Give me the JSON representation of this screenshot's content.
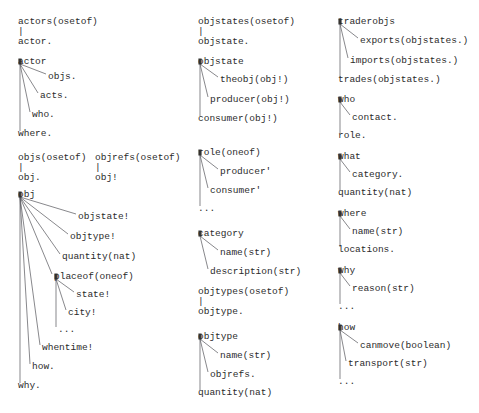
{
  "diagram": {
    "background_color": "#ffffff",
    "text_color": "#2b2b2b",
    "edge_color": "#55555a",
    "font": "monospace",
    "columns": [
      {
        "name": "column-left",
        "x": 18,
        "groups": [
          {
            "name": "actors-group",
            "root": "actors(osetof)",
            "connector": "|",
            "children": [
              "actor."
            ]
          },
          {
            "name": "actor-group",
            "root": "actor",
            "children": [
              "objs.",
              "acts.",
              "who.",
              "where."
            ]
          },
          {
            "name": "objs-group",
            "root": "objs(osetof)",
            "connector": "|",
            "children": [
              "obj."
            ]
          },
          {
            "name": "objrefs-group",
            "root": "objrefs(osetof)",
            "connector": "|",
            "children": [
              "obj!"
            ]
          },
          {
            "name": "obj-group",
            "root": "obj",
            "children": [
              "objstate!",
              "objtype!",
              "quantity(nat)",
              "placeof(oneof)",
              "whentime!",
              "how.",
              "why."
            ],
            "subgroup": {
              "name": "placeof-subgroup",
              "root": "placeof(oneof)",
              "children": [
                "state!",
                "city!",
                "..."
              ]
            }
          }
        ]
      },
      {
        "name": "column-middle",
        "x": 198,
        "groups": [
          {
            "name": "objstates-group",
            "root": "objstates(osetof)",
            "connector": "|",
            "children": [
              "objstate."
            ]
          },
          {
            "name": "objstate-group",
            "root": "objstate",
            "children": [
              "theobj(obj!)",
              "producer(obj!)",
              "consumer(obj!)"
            ]
          },
          {
            "name": "role-group",
            "root": "role(oneof)",
            "children": [
              "producer'",
              "consumer'",
              "..."
            ]
          },
          {
            "name": "category-group",
            "root": "category",
            "children": [
              "name(str)",
              "description(str)"
            ]
          },
          {
            "name": "objtypes-group",
            "root": "objtypes(osetof)",
            "connector": "|",
            "children": [
              "objtype."
            ]
          },
          {
            "name": "objtype-group",
            "root": "objtype",
            "children": [
              "name(str)",
              "objrefs.",
              "quantity(nat)"
            ]
          }
        ]
      },
      {
        "name": "column-right",
        "x": 338,
        "groups": [
          {
            "name": "traderobjs-group",
            "root": "traderobjs",
            "children": [
              "exports(objstates.)",
              "imports(objstates.)",
              "trades(objstates.)"
            ]
          },
          {
            "name": "who-group",
            "root": "who",
            "children": [
              "contact.",
              "role."
            ]
          },
          {
            "name": "what-group",
            "root": "what",
            "children": [
              "category.",
              "quantity(nat)"
            ]
          },
          {
            "name": "where-group",
            "root": "where",
            "children": [
              "name(str)",
              "locations."
            ]
          },
          {
            "name": "why-group",
            "root": "why",
            "children": [
              "reason(str)",
              "..."
            ]
          },
          {
            "name": "how-group",
            "root": "how",
            "children": [
              "canmove(boolean)",
              "transport(str)",
              "..."
            ]
          }
        ]
      }
    ],
    "labels": [
      {
        "id": "l1",
        "text": "actors(osetof)",
        "x": 18,
        "y": 17,
        "name": "node-actors"
      },
      {
        "id": "l2",
        "text": "|",
        "x": 18,
        "y": 27,
        "name": "connector-actors"
      },
      {
        "id": "l3",
        "text": "actor.",
        "x": 18,
        "y": 37,
        "name": "node-actor-ref"
      },
      {
        "id": "l4",
        "text": "actor",
        "x": 18,
        "y": 57,
        "name": "node-actor"
      },
      {
        "id": "l5",
        "text": "objs.",
        "x": 48,
        "y": 72,
        "name": "node-actor-objs"
      },
      {
        "id": "l6",
        "text": "acts.",
        "x": 40,
        "y": 91,
        "name": "node-actor-acts"
      },
      {
        "id": "l7",
        "text": "who.",
        "x": 32,
        "y": 110,
        "name": "node-actor-who"
      },
      {
        "id": "l8",
        "text": "where.",
        "x": 18,
        "y": 129,
        "name": "node-actor-where"
      },
      {
        "id": "l9",
        "text": "objs(osetof)",
        "x": 18,
        "y": 153,
        "name": "node-objs"
      },
      {
        "id": "l10",
        "text": "|",
        "x": 18,
        "y": 163,
        "name": "connector-objs"
      },
      {
        "id": "l11",
        "text": "obj.",
        "x": 18,
        "y": 173,
        "name": "node-obj-ref"
      },
      {
        "id": "l12",
        "text": "objrefs(osetof)",
        "x": 95,
        "y": 153,
        "name": "node-objrefs"
      },
      {
        "id": "l13",
        "text": "|",
        "x": 95,
        "y": 163,
        "name": "connector-objrefs"
      },
      {
        "id": "l14",
        "text": "obj!",
        "x": 95,
        "y": 173,
        "name": "node-obj-bang"
      },
      {
        "id": "l15",
        "text": "obj",
        "x": 18,
        "y": 190,
        "name": "node-obj"
      },
      {
        "id": "l16",
        "text": "objstate!",
        "x": 78,
        "y": 212,
        "name": "node-obj-objstate"
      },
      {
        "id": "l17",
        "text": "objtype!",
        "x": 70,
        "y": 232,
        "name": "node-obj-objtype"
      },
      {
        "id": "l18",
        "text": "quantity(nat)",
        "x": 62,
        "y": 252,
        "name": "node-obj-quantity"
      },
      {
        "id": "l19",
        "text": "placeof(oneof)",
        "x": 54,
        "y": 272,
        "name": "node-obj-placeof"
      },
      {
        "id": "l20",
        "text": "state!",
        "x": 76,
        "y": 290,
        "name": "node-placeof-state"
      },
      {
        "id": "l21",
        "text": "city!",
        "x": 68,
        "y": 308,
        "name": "node-placeof-city"
      },
      {
        "id": "l22",
        "text": "...",
        "x": 58,
        "y": 325,
        "name": "node-placeof-more"
      },
      {
        "id": "l23",
        "text": "whentime!",
        "x": 42,
        "y": 343,
        "name": "node-obj-whentime"
      },
      {
        "id": "l24",
        "text": "how.",
        "x": 32,
        "y": 362,
        "name": "node-obj-how"
      },
      {
        "id": "l25",
        "text": "why.",
        "x": 18,
        "y": 381,
        "name": "node-obj-why"
      },
      {
        "id": "m1",
        "text": "objstates(osetof)",
        "x": 198,
        "y": 17,
        "name": "node-objstates"
      },
      {
        "id": "m2",
        "text": "|",
        "x": 198,
        "y": 27,
        "name": "connector-objstates"
      },
      {
        "id": "m3",
        "text": "objstate.",
        "x": 198,
        "y": 37,
        "name": "node-objstate-ref"
      },
      {
        "id": "m4",
        "text": "objstate",
        "x": 198,
        "y": 57,
        "name": "node-objstate"
      },
      {
        "id": "m5",
        "text": "theobj(obj!)",
        "x": 220,
        "y": 75,
        "name": "node-objstate-theobj"
      },
      {
        "id": "m6",
        "text": "producer(obj!)",
        "x": 210,
        "y": 95,
        "name": "node-objstate-producer"
      },
      {
        "id": "m7",
        "text": "consumer(obj!)",
        "x": 198,
        "y": 114,
        "name": "node-objstate-consumer"
      },
      {
        "id": "m8",
        "text": "role(oneof)",
        "x": 198,
        "y": 148,
        "name": "node-role"
      },
      {
        "id": "m9",
        "text": "producer'",
        "x": 220,
        "y": 167,
        "name": "node-role-producer"
      },
      {
        "id": "m10",
        "text": "consumer'",
        "x": 210,
        "y": 186,
        "name": "node-role-consumer"
      },
      {
        "id": "m11",
        "text": "...",
        "x": 198,
        "y": 204,
        "name": "node-role-more"
      },
      {
        "id": "m12",
        "text": "category",
        "x": 198,
        "y": 229,
        "name": "node-category"
      },
      {
        "id": "m13",
        "text": "name(str)",
        "x": 220,
        "y": 248,
        "name": "node-category-name"
      },
      {
        "id": "m14",
        "text": "description(str)",
        "x": 210,
        "y": 267,
        "name": "node-category-description"
      },
      {
        "id": "m15",
        "text": "objtypes(osetof)",
        "x": 198,
        "y": 287,
        "name": "node-objtypes"
      },
      {
        "id": "m16",
        "text": "|",
        "x": 198,
        "y": 297,
        "name": "connector-objtypes"
      },
      {
        "id": "m17",
        "text": "objtype.",
        "x": 198,
        "y": 307,
        "name": "node-objtype-ref"
      },
      {
        "id": "m18",
        "text": "objtype",
        "x": 198,
        "y": 332,
        "name": "node-objtype"
      },
      {
        "id": "m19",
        "text": "name(str)",
        "x": 220,
        "y": 351,
        "name": "node-objtype-name"
      },
      {
        "id": "m20",
        "text": "objrefs.",
        "x": 210,
        "y": 370,
        "name": "node-objtype-objrefs"
      },
      {
        "id": "m21",
        "text": "quantity(nat)",
        "x": 198,
        "y": 388,
        "name": "node-objtype-quantity"
      },
      {
        "id": "r1",
        "text": "traderobjs",
        "x": 338,
        "y": 17,
        "name": "node-traderobjs"
      },
      {
        "id": "r2",
        "text": "exports(objstates.)",
        "x": 360,
        "y": 36,
        "name": "node-traderobjs-exports"
      },
      {
        "id": "r3",
        "text": "imports(objstates.)",
        "x": 350,
        "y": 56,
        "name": "node-traderobjs-imports"
      },
      {
        "id": "r4",
        "text": "trades(objstates.)",
        "x": 338,
        "y": 75,
        "name": "node-traderobjs-trades"
      },
      {
        "id": "r5",
        "text": "who",
        "x": 338,
        "y": 95,
        "name": "node-who"
      },
      {
        "id": "r6",
        "text": "contact.",
        "x": 352,
        "y": 113,
        "name": "node-who-contact"
      },
      {
        "id": "r7",
        "text": "role.",
        "x": 338,
        "y": 131,
        "name": "node-who-role"
      },
      {
        "id": "r8",
        "text": "what",
        "x": 338,
        "y": 152,
        "name": "node-what"
      },
      {
        "id": "r9",
        "text": "category.",
        "x": 352,
        "y": 170,
        "name": "node-what-category"
      },
      {
        "id": "r10",
        "text": "quantity(nat)",
        "x": 338,
        "y": 188,
        "name": "node-what-quantity"
      },
      {
        "id": "r11",
        "text": "where",
        "x": 338,
        "y": 209,
        "name": "node-where"
      },
      {
        "id": "r12",
        "text": "name(str)",
        "x": 352,
        "y": 227,
        "name": "node-where-name"
      },
      {
        "id": "r13",
        "text": "locations.",
        "x": 338,
        "y": 245,
        "name": "node-where-locations"
      },
      {
        "id": "r14",
        "text": "why",
        "x": 338,
        "y": 266,
        "name": "node-why"
      },
      {
        "id": "r15",
        "text": "reason(str)",
        "x": 352,
        "y": 284,
        "name": "node-why-reason"
      },
      {
        "id": "r16",
        "text": "...",
        "x": 338,
        "y": 302,
        "name": "node-why-more"
      },
      {
        "id": "r17",
        "text": "how",
        "x": 338,
        "y": 323,
        "name": "node-how"
      },
      {
        "id": "r18",
        "text": "canmove(boolean)",
        "x": 360,
        "y": 341,
        "name": "node-how-canmove"
      },
      {
        "id": "r19",
        "text": "transport(str)",
        "x": 348,
        "y": 359,
        "name": "node-how-transport"
      },
      {
        "id": "r20",
        "text": "...",
        "x": 338,
        "y": 377,
        "name": "node-how-more"
      }
    ],
    "edges": [
      {
        "name": "edge-actor-objs",
        "x1": 20,
        "y1": 64,
        "x2": 46,
        "y2": 74
      },
      {
        "name": "edge-actor-acts",
        "x1": 20,
        "y1": 64,
        "x2": 38,
        "y2": 93
      },
      {
        "name": "edge-actor-who",
        "x1": 20,
        "y1": 64,
        "x2": 30,
        "y2": 112
      },
      {
        "name": "edge-actor-where",
        "x1": 20,
        "y1": 64,
        "x2": 20,
        "y2": 131
      },
      {
        "name": "edge-obj-objstate",
        "x1": 20,
        "y1": 197,
        "x2": 76,
        "y2": 214
      },
      {
        "name": "edge-obj-objtype",
        "x1": 20,
        "y1": 197,
        "x2": 68,
        "y2": 234
      },
      {
        "name": "edge-obj-quantity",
        "x1": 20,
        "y1": 197,
        "x2": 60,
        "y2": 254
      },
      {
        "name": "edge-obj-placeof",
        "x1": 20,
        "y1": 197,
        "x2": 52,
        "y2": 274
      },
      {
        "name": "edge-obj-whentime",
        "x1": 20,
        "y1": 197,
        "x2": 40,
        "y2": 345
      },
      {
        "name": "edge-obj-how",
        "x1": 20,
        "y1": 197,
        "x2": 30,
        "y2": 364
      },
      {
        "name": "edge-obj-why",
        "x1": 20,
        "y1": 197,
        "x2": 20,
        "y2": 383
      },
      {
        "name": "edge-placeof-state",
        "x1": 56,
        "y1": 279,
        "x2": 74,
        "y2": 292
      },
      {
        "name": "edge-placeof-city",
        "x1": 56,
        "y1": 279,
        "x2": 66,
        "y2": 310
      },
      {
        "name": "edge-placeof-more",
        "x1": 56,
        "y1": 279,
        "x2": 56,
        "y2": 327
      },
      {
        "name": "edge-objstate-theobj",
        "x1": 200,
        "y1": 64,
        "x2": 218,
        "y2": 77
      },
      {
        "name": "edge-objstate-producer",
        "x1": 200,
        "y1": 64,
        "x2": 208,
        "y2": 97
      },
      {
        "name": "edge-objstate-consumer",
        "x1": 200,
        "y1": 64,
        "x2": 200,
        "y2": 116
      },
      {
        "name": "edge-role-producer",
        "x1": 200,
        "y1": 155,
        "x2": 218,
        "y2": 169
      },
      {
        "name": "edge-role-consumer",
        "x1": 200,
        "y1": 155,
        "x2": 208,
        "y2": 188
      },
      {
        "name": "edge-role-more",
        "x1": 200,
        "y1": 155,
        "x2": 200,
        "y2": 206
      },
      {
        "name": "edge-category-name",
        "x1": 200,
        "y1": 236,
        "x2": 218,
        "y2": 250
      },
      {
        "name": "edge-category-desc",
        "x1": 200,
        "y1": 236,
        "x2": 208,
        "y2": 269
      },
      {
        "name": "edge-objtype-name",
        "x1": 200,
        "y1": 339,
        "x2": 218,
        "y2": 353
      },
      {
        "name": "edge-objtype-objrefs",
        "x1": 200,
        "y1": 339,
        "x2": 208,
        "y2": 372
      },
      {
        "name": "edge-objtype-quantity",
        "x1": 200,
        "y1": 339,
        "x2": 200,
        "y2": 390
      },
      {
        "name": "edge-trader-exports",
        "x1": 340,
        "y1": 24,
        "x2": 358,
        "y2": 38
      },
      {
        "name": "edge-trader-imports",
        "x1": 340,
        "y1": 24,
        "x2": 348,
        "y2": 58
      },
      {
        "name": "edge-trader-trades",
        "x1": 340,
        "y1": 24,
        "x2": 340,
        "y2": 77
      },
      {
        "name": "edge-who-contact",
        "x1": 340,
        "y1": 102,
        "x2": 350,
        "y2": 115
      },
      {
        "name": "edge-who-role",
        "x1": 340,
        "y1": 102,
        "x2": 340,
        "y2": 133
      },
      {
        "name": "edge-what-category",
        "x1": 340,
        "y1": 159,
        "x2": 350,
        "y2": 172
      },
      {
        "name": "edge-what-quantity",
        "x1": 340,
        "y1": 159,
        "x2": 340,
        "y2": 190
      },
      {
        "name": "edge-where-name",
        "x1": 340,
        "y1": 216,
        "x2": 350,
        "y2": 229
      },
      {
        "name": "edge-where-locations",
        "x1": 340,
        "y1": 216,
        "x2": 340,
        "y2": 247
      },
      {
        "name": "edge-why-reason",
        "x1": 340,
        "y1": 273,
        "x2": 350,
        "y2": 286
      },
      {
        "name": "edge-why-more",
        "x1": 340,
        "y1": 273,
        "x2": 340,
        "y2": 304
      },
      {
        "name": "edge-how-canmove",
        "x1": 340,
        "y1": 330,
        "x2": 358,
        "y2": 343
      },
      {
        "name": "edge-how-transport",
        "x1": 340,
        "y1": 330,
        "x2": 346,
        "y2": 361
      },
      {
        "name": "edge-how-more",
        "x1": 340,
        "y1": 330,
        "x2": 340,
        "y2": 379
      }
    ],
    "anchors": [
      {
        "name": "anchor-actor",
        "x": 20,
        "y": 64
      },
      {
        "name": "anchor-obj",
        "x": 20,
        "y": 197
      },
      {
        "name": "anchor-placeof",
        "x": 56,
        "y": 279
      },
      {
        "name": "anchor-objstate",
        "x": 200,
        "y": 64
      },
      {
        "name": "anchor-role",
        "x": 200,
        "y": 155
      },
      {
        "name": "anchor-category",
        "x": 200,
        "y": 236
      },
      {
        "name": "anchor-objtype",
        "x": 200,
        "y": 339
      },
      {
        "name": "anchor-traderobjs",
        "x": 340,
        "y": 24
      },
      {
        "name": "anchor-who",
        "x": 340,
        "y": 102
      },
      {
        "name": "anchor-what",
        "x": 340,
        "y": 159
      },
      {
        "name": "anchor-where",
        "x": 340,
        "y": 216
      },
      {
        "name": "anchor-why",
        "x": 340,
        "y": 273
      },
      {
        "name": "anchor-how",
        "x": 340,
        "y": 330
      }
    ]
  }
}
